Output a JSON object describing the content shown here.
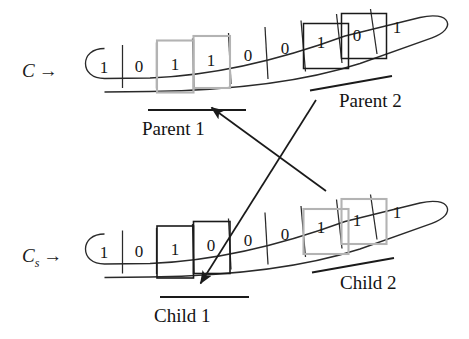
{
  "figure": {
    "type": "diagram",
    "rows": [
      {
        "id": "parent-row",
        "label": "C",
        "label_subscript": "",
        "label_arrow": "→",
        "bits": [
          "1",
          "0",
          "1",
          "1",
          "0",
          "0",
          "1",
          "0",
          "1"
        ],
        "highlights": [
          {
            "name": "parent-1",
            "caption": "Parent 1",
            "cells": [
              2,
              3
            ],
            "box_color": "#b3b3b3",
            "bar_tilted": false
          },
          {
            "name": "parent-2",
            "caption": "Parent 2",
            "cells": [
              6,
              7
            ],
            "box_color": "#1a1a1a",
            "bar_tilted": true
          }
        ]
      },
      {
        "id": "child-row",
        "label": "C",
        "label_subscript": "s",
        "label_arrow": "→",
        "bits": [
          "1",
          "0",
          "1",
          "0",
          "0",
          "0",
          "1",
          "1",
          "1"
        ],
        "highlights": [
          {
            "name": "child-1",
            "caption": "Child 1",
            "cells": [
              2,
              3
            ],
            "box_color": "#1a1a1a",
            "bar_tilted": false
          },
          {
            "name": "child-2",
            "caption": "Child 2",
            "cells": [
              6,
              7
            ],
            "box_color": "#b3b3b3",
            "bar_tilted": true
          }
        ]
      }
    ],
    "crossover_arrows": [
      {
        "name": "parent2-to-child1",
        "from": "Parent 2",
        "to": "Child 1"
      },
      {
        "name": "parent1-to-child2",
        "from": "Parent 1",
        "to": "Child 2"
      }
    ],
    "colors": {
      "ink": "#1a1a1a",
      "gray_box": "#b3b3b3",
      "background": "#ffffff"
    }
  }
}
